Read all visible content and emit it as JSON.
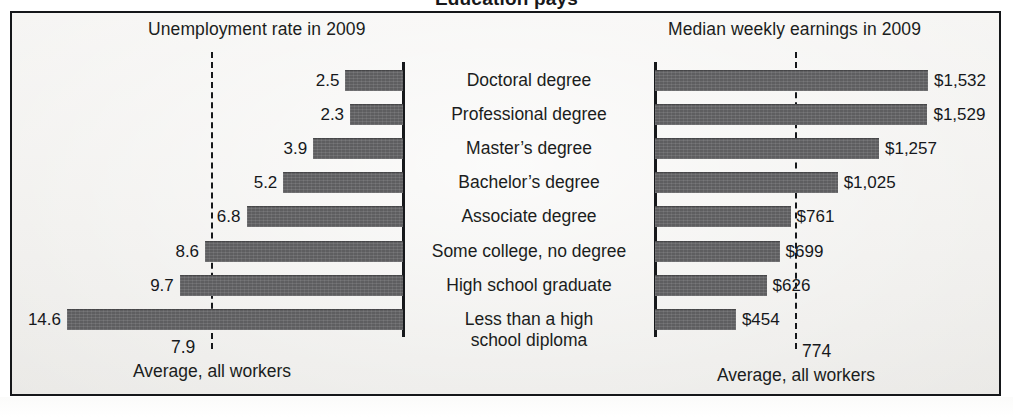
{
  "cut_off_headline": "Education pays",
  "frame": {
    "border_color": "#15171a",
    "background_color": "#f2f1ef"
  },
  "panels": {
    "left": {
      "title": "Unemployment rate in 2009",
      "average_value": "7.9",
      "average_caption": "Average, all workers"
    },
    "right": {
      "title": "Median weekly earnings in 2009",
      "average_value": "774",
      "average_caption": "Average, all workers"
    }
  },
  "categories": [
    {
      "line1": "Doctoral degree",
      "line2": ""
    },
    {
      "line1": "Professional degree",
      "line2": ""
    },
    {
      "line1": "Master’s degree",
      "line2": ""
    },
    {
      "line1": "Bachelor’s degree",
      "line2": ""
    },
    {
      "line1": "Associate degree",
      "line2": ""
    },
    {
      "line1": "Some college, no degree",
      "line2": ""
    },
    {
      "line1": "High school graduate",
      "line2": ""
    },
    {
      "line1": "Less than a high",
      "line2": "school diploma"
    }
  ],
  "unemployment_labels": [
    "2.5",
    "2.3",
    "3.9",
    "5.2",
    "6.8",
    "8.6",
    "9.7",
    "14.6"
  ],
  "earnings_labels": [
    "$1,532",
    "$1,529",
    "$1,257",
    "$1,025",
    "$761",
    "$699",
    "$626",
    "$454"
  ],
  "colors": {
    "bar": "#5e5e60",
    "text": "#16181b",
    "rule": "#16181b"
  },
  "chart_data": [
    {
      "type": "bar",
      "orientation": "horizontal-left",
      "title": "Unemployment rate in 2009",
      "xlabel": "Unemployment rate (percent)",
      "ylabel": "",
      "categories": [
        "Doctoral degree",
        "Professional degree",
        "Master's degree",
        "Bachelor's degree",
        "Associate degree",
        "Some college, no degree",
        "High school graduate",
        "Less than a high school diploma"
      ],
      "values": [
        2.5,
        2.3,
        3.9,
        5.2,
        6.8,
        8.6,
        9.7,
        14.6
      ],
      "data_labels": [
        "2.5",
        "2.3",
        "3.9",
        "5.2",
        "6.8",
        "8.6",
        "9.7",
        "14.6"
      ],
      "xlim": [
        0,
        14.6
      ],
      "grid": false,
      "legend": "none",
      "annotations": [
        {
          "kind": "reference-line",
          "style": "dashed",
          "value": 7.9,
          "label": "7.9",
          "caption": "Average, all workers"
        }
      ]
    },
    {
      "type": "bar",
      "orientation": "horizontal-right",
      "title": "Median weekly earnings in 2009",
      "xlabel": "Median weekly earnings (dollars)",
      "ylabel": "",
      "categories": [
        "Doctoral degree",
        "Professional degree",
        "Master's degree",
        "Bachelor's degree",
        "Associate degree",
        "Some college, no degree",
        "High school graduate",
        "Less than a high school diploma"
      ],
      "values": [
        1532,
        1529,
        1257,
        1025,
        761,
        699,
        626,
        454
      ],
      "data_labels": [
        "$1,532",
        "$1,529",
        "$1,257",
        "$1,025",
        "$761",
        "$699",
        "$626",
        "$454"
      ],
      "xlim": [
        0,
        1532
      ],
      "grid": false,
      "legend": "none",
      "annotations": [
        {
          "kind": "reference-line",
          "style": "dashed",
          "value": 774,
          "label": "774",
          "caption": "Average, all workers"
        }
      ]
    }
  ]
}
